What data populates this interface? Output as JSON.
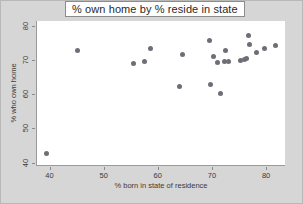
{
  "chart_data": {
    "type": "scatter",
    "title": "% own home by % reside in state",
    "xlabel": "% born in state of residence",
    "ylabel": "% who own home",
    "xlim": [
      37.5,
      83.5
    ],
    "ylim": [
      39.0,
      81.5
    ],
    "xticks": [
      40,
      50,
      60,
      70,
      80
    ],
    "yticks": [
      40,
      50,
      60,
      70,
      80
    ],
    "grid": false,
    "legend": null,
    "marker_color": "#6e6e76",
    "panel_background": "#ffffff",
    "figure_background": "#d6d6d6",
    "points": [
      {
        "x": 39.5,
        "y": 42.8
      },
      {
        "x": 45.2,
        "y": 72.8
      },
      {
        "x": 55.5,
        "y": 69.1
      },
      {
        "x": 57.6,
        "y": 69.6
      },
      {
        "x": 58.6,
        "y": 73.3
      },
      {
        "x": 64.0,
        "y": 62.2
      },
      {
        "x": 64.6,
        "y": 71.6
      },
      {
        "x": 69.6,
        "y": 75.9
      },
      {
        "x": 69.8,
        "y": 63.0
      },
      {
        "x": 70.2,
        "y": 71.2
      },
      {
        "x": 71.1,
        "y": 69.3
      },
      {
        "x": 71.5,
        "y": 60.3
      },
      {
        "x": 72.3,
        "y": 69.6
      },
      {
        "x": 72.6,
        "y": 72.8
      },
      {
        "x": 73.0,
        "y": 69.7
      },
      {
        "x": 75.2,
        "y": 69.9
      },
      {
        "x": 76.0,
        "y": 70.2
      },
      {
        "x": 76.4,
        "y": 70.4
      },
      {
        "x": 76.8,
        "y": 77.2
      },
      {
        "x": 77.0,
        "y": 74.5
      },
      {
        "x": 78.2,
        "y": 72.3
      },
      {
        "x": 79.8,
        "y": 73.5
      },
      {
        "x": 81.8,
        "y": 74.3
      }
    ]
  }
}
